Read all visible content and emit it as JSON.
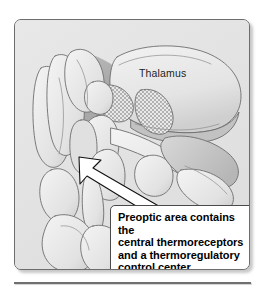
{
  "figure": {
    "kind": "anatomical-illustration",
    "labels": {
      "thalamus": "Thalamus"
    },
    "callout": {
      "text": "Preoptic area contains the\ncentral thermoreceptors\nand a thermoregulatory\ncontrol center.",
      "lines": [
        "Preoptic area contains the",
        "central thermoreceptors",
        "and a thermoregulatory",
        "control center."
      ],
      "pointer_target": "preoptic-area"
    },
    "colors": {
      "page_background": "#ffffff",
      "frame_background": "#e3e3e3",
      "frame_border": "#6d6d6d",
      "outline": "#6a6a6a",
      "structure_fill_light": "#efefef",
      "structure_fill_mid": "#dcdcdc",
      "structure_fill_dark": "#c4c4c4",
      "shadow_fill": "#b0b0b0",
      "callout_background": "#ffffff",
      "callout_border": "#4a4a4a",
      "text": "#000000",
      "rule": "#6f6f6f"
    }
  }
}
